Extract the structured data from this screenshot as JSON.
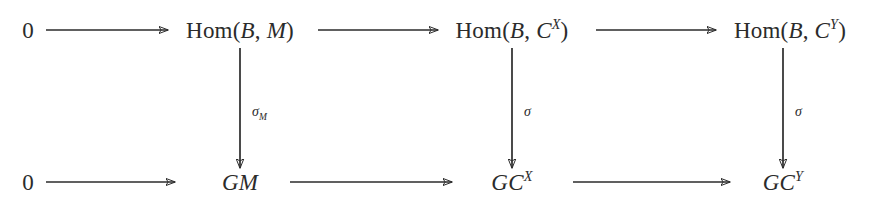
{
  "diagram": {
    "type": "commutative-diagram",
    "background_color": "#ffffff",
    "stroke_color": "#2b2b2b",
    "rows": [
      {
        "name": "top-row",
        "nodes": [
          {
            "id": "top-zero",
            "label": "0",
            "base": "0",
            "sup": "",
            "x": 28,
            "y": 30,
            "style": "upright"
          },
          {
            "id": "top-hom-m",
            "label": "Hom(B, M)",
            "base": "Hom(",
            "sup": "",
            "x": 240,
            "y": 30,
            "style": "hom"
          },
          {
            "id": "top-hom-cx",
            "label": "Hom(B, C^X)",
            "base": "Hom(",
            "sup": "X",
            "x": 512,
            "y": 30,
            "style": "hom"
          },
          {
            "id": "top-hom-cy",
            "label": "Hom(B, C^Y)",
            "base": "Hom(",
            "sup": "Y",
            "x": 790,
            "y": 30,
            "style": "hom"
          }
        ]
      },
      {
        "name": "bottom-row",
        "nodes": [
          {
            "id": "bot-zero",
            "label": "0",
            "base": "0",
            "sup": "",
            "x": 28,
            "y": 182,
            "style": "upright"
          },
          {
            "id": "bot-gm",
            "label": "GM",
            "base": "GM",
            "sup": "",
            "x": 240,
            "y": 182,
            "style": "italic"
          },
          {
            "id": "bot-gcx",
            "label": "GC^X",
            "base": "GC",
            "sup": "X",
            "x": 512,
            "y": 182,
            "style": "italic"
          },
          {
            "id": "bot-gcy",
            "label": "GC^Y",
            "base": "GC",
            "sup": "Y",
            "x": 783,
            "y": 182,
            "style": "italic"
          }
        ]
      }
    ],
    "horizontal_arrows": [
      {
        "id": "top-arrow-1",
        "from": "top-zero",
        "to": "top-hom-m",
        "label": "",
        "x1": 46,
        "x2": 168,
        "y": 30
      },
      {
        "id": "top-arrow-2",
        "from": "top-hom-m",
        "to": "top-hom-cx",
        "label": "",
        "x1": 318,
        "x2": 438,
        "y": 30
      },
      {
        "id": "top-arrow-3",
        "from": "top-hom-cx",
        "to": "top-hom-cy",
        "label": "",
        "x1": 596,
        "x2": 716,
        "y": 30
      },
      {
        "id": "bot-arrow-1",
        "from": "bot-zero",
        "to": "bot-gm",
        "label": "",
        "x1": 46,
        "x2": 175,
        "y": 182
      },
      {
        "id": "bot-arrow-2",
        "from": "bot-gm",
        "to": "bot-gcx",
        "label": "",
        "x1": 290,
        "x2": 452,
        "y": 182
      },
      {
        "id": "bot-arrow-3",
        "from": "bot-gcx",
        "to": "bot-gcy",
        "label": "",
        "x1": 573,
        "x2": 730,
        "y": 182
      }
    ],
    "vertical_arrows": [
      {
        "id": "vert-arrow-sigma-m",
        "from": "top-hom-m",
        "to": "bot-gm",
        "label_base": "σ",
        "label_sub": "M",
        "x": 240,
        "y1": 48,
        "y2": 168,
        "label_x": 252,
        "label_y": 112
      },
      {
        "id": "vert-arrow-sigma-1",
        "from": "top-hom-cx",
        "to": "bot-gcx",
        "label_base": "σ",
        "label_sub": "",
        "x": 512,
        "y1": 48,
        "y2": 168,
        "label_x": 524,
        "label_y": 112
      },
      {
        "id": "vert-arrow-sigma-2",
        "from": "top-hom-cy",
        "to": "bot-gcy",
        "label_base": "σ",
        "label_sub": "",
        "x": 783,
        "y1": 48,
        "y2": 168,
        "label_x": 795,
        "label_y": 112
      }
    ],
    "text_parts": {
      "hom_open": "Hom(",
      "b_var": "B",
      "comma": ", ",
      "m_var": "M",
      "c_var": "C",
      "close_paren": ")",
      "sup_x": "X",
      "sup_y": "Y",
      "g_var": "G",
      "gm": "GM",
      "gc": "GC",
      "zero": "0",
      "sigma": "σ",
      "sub_m": "M"
    }
  }
}
